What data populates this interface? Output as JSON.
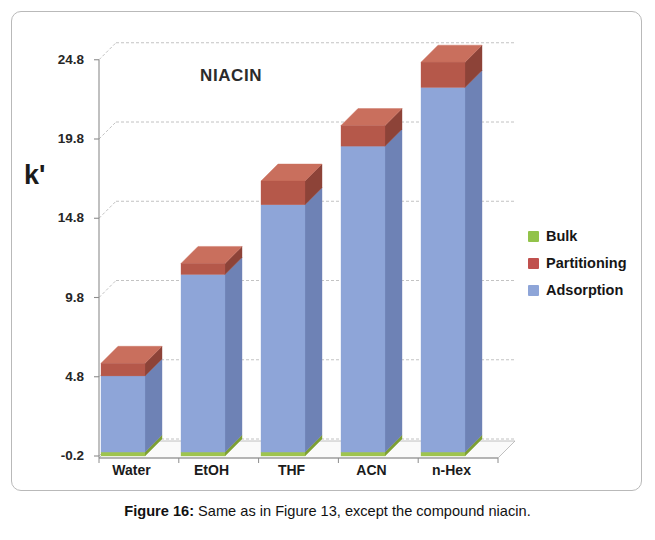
{
  "chart_title": "NIACIN",
  "y_axis_title": "k'",
  "caption": {
    "label": "Figure 16:",
    "text": " Same as in Figure 13, except the compound niacin."
  },
  "legend": {
    "position": "right",
    "items": [
      {
        "label": "Bulk",
        "color": "#92c34a"
      },
      {
        "label": "Partitioning",
        "color": "#c0504d"
      },
      {
        "label": "Adsorption",
        "color": "#8ea5d8"
      }
    ]
  },
  "ticks": [
    "24.8",
    "19.8",
    "14.8",
    "9.8",
    "4.8",
    "-0.2"
  ],
  "categories": [
    "Water",
    "EtOH",
    "THF",
    "ACN",
    "n-Hex"
  ],
  "chart_data": {
    "type": "bar",
    "subtype": "stacked-3d-column",
    "title": "NIACIN",
    "xlabel": "",
    "ylabel": "k'",
    "ylim": [
      -0.2,
      24.8
    ],
    "ytick_values": [
      -0.2,
      4.8,
      9.8,
      14.8,
      19.8,
      24.8
    ],
    "grid": true,
    "legend_position": "right",
    "categories": [
      "Water",
      "EtOH",
      "THF",
      "ACN",
      "n-Hex"
    ],
    "series": [
      {
        "name": "Bulk",
        "color": "#92c34a",
        "values": [
          0.25,
          0.25,
          0.25,
          0.25,
          0.25
        ]
      },
      {
        "name": "Adsorption",
        "color": "#8ea5d8",
        "values": [
          4.8,
          11.2,
          15.6,
          19.3,
          23.0
        ]
      },
      {
        "name": "Partitioning",
        "color": "#c0504d",
        "values": [
          0.8,
          0.7,
          1.5,
          1.3,
          1.6
        ]
      }
    ],
    "totals": [
      5.85,
      12.15,
      17.35,
      20.85,
      24.85
    ],
    "stack_order": [
      "Bulk",
      "Adsorption",
      "Partitioning"
    ]
  },
  "geometry": {
    "baseline_y": 456,
    "pixels_per_unit": 15.85,
    "depth_dx": 17,
    "depth_dy": -17,
    "bar_width": 44,
    "bar_left_x": [
      101,
      181,
      261,
      341,
      421
    ]
  },
  "colors": {
    "blue_front": "#8ea5d8",
    "blue_side": "#6e82b5",
    "blue_top": "#a6b8e0",
    "red_front": "#b5584a",
    "red_side": "#8d4338",
    "red_top": "#c96f5d",
    "green_front": "#9ec44e",
    "green_side": "#7da034",
    "floor": "#fafafa",
    "grid": "#9a9a9a",
    "axis": "#8c8c8c"
  }
}
